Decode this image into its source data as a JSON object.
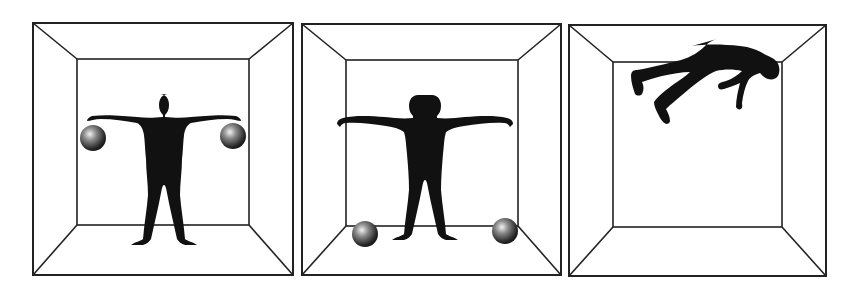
{
  "figure": {
    "panels": [
      {
        "id": "panel-1",
        "description": "Standing figure holding two balls in outstretched arms",
        "outer": [
          33,
          23,
          293,
          275
        ],
        "inner": [
          77,
          59,
          249,
          225
        ],
        "balls": [
          {
            "cx": 93,
            "cy": 138,
            "r": 13
          },
          {
            "cx": 233,
            "cy": 136,
            "r": 13
          }
        ]
      },
      {
        "id": "panel-2",
        "description": "Standing figure with arms outstretched, balls resting on floor",
        "outer": [
          302,
          24,
          561,
          275
        ],
        "inner": [
          346,
          60,
          518,
          226
        ],
        "balls": [
          {
            "cx": 365,
            "cy": 234,
            "r": 13
          },
          {
            "cx": 505,
            "cy": 231,
            "r": 13
          }
        ]
      },
      {
        "id": "panel-3",
        "description": "Figure floating near ceiling",
        "outer": [
          569,
          25,
          826,
          276
        ],
        "inner": [
          613,
          62,
          782,
          227
        ],
        "balls": []
      }
    ],
    "colors": {
      "line": "#222222",
      "silhouette": "#111111",
      "background": "#ffffff"
    }
  }
}
